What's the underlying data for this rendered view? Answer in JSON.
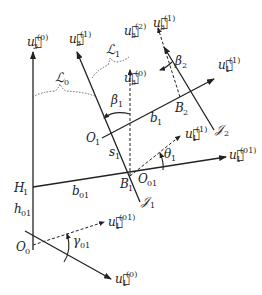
{
  "diagram": {
    "type": "kinematic-frame-diagram",
    "colors": {
      "stroke": "#222222",
      "dashed_curve": "#555555",
      "background": "#ffffff"
    },
    "labels": {
      "u3_0_top": {
        "base": "u",
        "sub": "3",
        "sup": "(0)"
      },
      "u3_1_top": {
        "base": "u",
        "sub": "3",
        "sup": "(1)"
      },
      "u3_2": {
        "base": "u",
        "sub": "3",
        "sup": "(2)"
      },
      "u3_1_right": {
        "base": "u",
        "sub": "3",
        "sup": "(1)"
      },
      "u3_0_mid": {
        "base": "u",
        "sub": "3",
        "sup": "(0)"
      },
      "u1_1_right": {
        "base": "u",
        "sub": "1",
        "sup": "(1)"
      },
      "u1_1_mid": {
        "base": "u",
        "sub": "1",
        "sup": "(1)"
      },
      "u1_01_right": {
        "base": "u",
        "sub": "1",
        "sup": "(01)"
      },
      "u1_01_bottom": {
        "base": "u",
        "sub": "1",
        "sup": "(01)"
      },
      "u1_0_bottom": {
        "base": "u",
        "sub": "1",
        "sup": "(0)"
      },
      "L0": {
        "base": "ℒ",
        "sub": "0"
      },
      "L1": {
        "base": "ℒ",
        "sub": "1"
      },
      "beta1": {
        "base": "β",
        "sub": "1"
      },
      "beta2": {
        "base": "β",
        "sub": "2"
      },
      "theta1": {
        "base": "θ",
        "sub": "1"
      },
      "gamma01": {
        "base": "γ",
        "sub": "01"
      },
      "O1": {
        "base": "O",
        "sub": "1"
      },
      "O0": {
        "base": "O",
        "sub": "0"
      },
      "O01": {
        "base": "O",
        "sub": "01"
      },
      "B1": {
        "base": "B",
        "sub": "1"
      },
      "B2": {
        "base": "B",
        "sub": "2"
      },
      "H1": {
        "base": "H",
        "sub": "1"
      },
      "b1": {
        "base": "b",
        "sub": "1"
      },
      "b01": {
        "base": "b",
        "sub": "01"
      },
      "h01": {
        "base": "h",
        "sub": "01"
      },
      "s1": {
        "base": "s",
        "sub": "1"
      },
      "J1": {
        "base": "𝒥",
        "sub": "1"
      },
      "J2": {
        "base": "𝒥",
        "sub": "2"
      }
    }
  }
}
